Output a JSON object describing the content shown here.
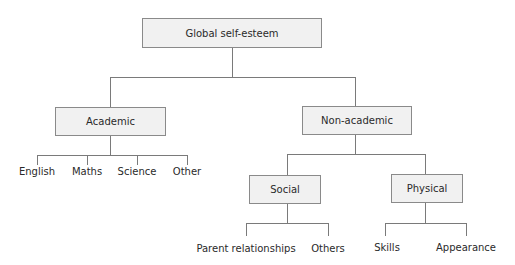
{
  "diagram": {
    "root": {
      "label": "Global self-esteem"
    },
    "academic": {
      "label": "Academic",
      "children": [
        "English",
        "Maths",
        "Science",
        "Other"
      ]
    },
    "non_academic": {
      "label": "Non-academic",
      "social": {
        "label": "Social",
        "children": [
          "Parent relationships",
          "Others"
        ]
      },
      "physical": {
        "label": "Physical",
        "children": [
          "Skills",
          "Appearance"
        ]
      }
    }
  },
  "colors": {
    "box_fill": "#f1f1f1",
    "box_border": "#8a8a8a",
    "line": "#7a7a7a"
  }
}
